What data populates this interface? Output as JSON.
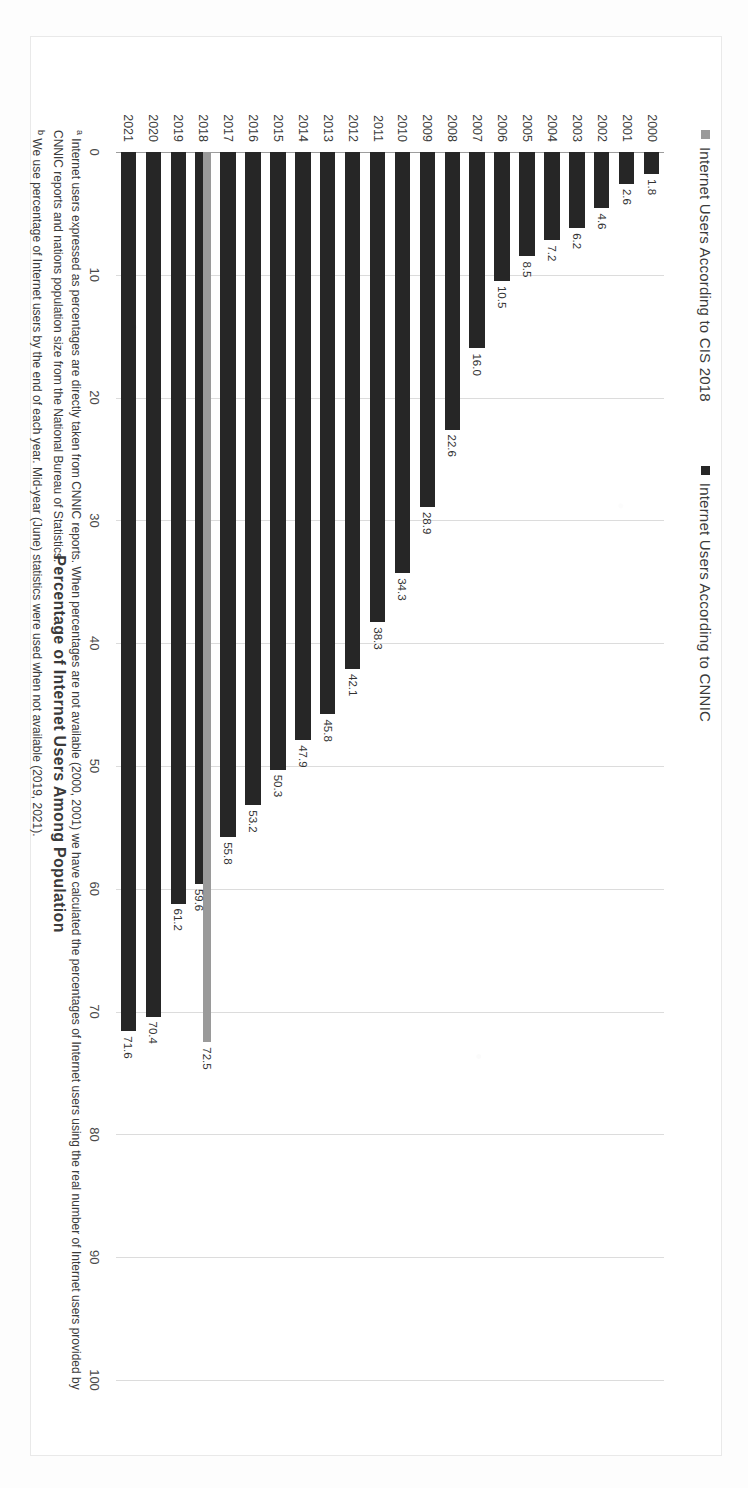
{
  "chart_data": {
    "type": "bar",
    "title": "",
    "xlabel": "",
    "ylabel": "Percentage of Internet Users Among Population",
    "orientation": "vertical",
    "ylim": [
      0,
      100
    ],
    "yticks": [
      "0",
      "10",
      "20",
      "30",
      "40",
      "50",
      "60",
      "70",
      "80",
      "90",
      "100"
    ],
    "grid": true,
    "legend_position": "top-left",
    "categories": [
      "2000",
      "2001",
      "2002",
      "2003",
      "2004",
      "2005",
      "2006",
      "2007",
      "2008",
      "2009",
      "2010",
      "2011",
      "2012",
      "2013",
      "2014",
      "2015",
      "2016",
      "2017",
      "2018",
      "2019",
      "2020",
      "2021"
    ],
    "series": [
      {
        "name": "Internet Users According to CIS 2018",
        "color": "#9a9a9a",
        "values": [
          null,
          null,
          null,
          null,
          null,
          null,
          null,
          null,
          null,
          null,
          null,
          null,
          null,
          null,
          null,
          null,
          null,
          null,
          72.5,
          null,
          null,
          null
        ]
      },
      {
        "name": "Internet Users According to CNNIC",
        "color": "#262626",
        "values": [
          1.8,
          2.6,
          4.6,
          6.2,
          7.2,
          8.5,
          10.5,
          16.0,
          22.6,
          28.9,
          34.3,
          38.3,
          42.1,
          45.8,
          47.9,
          50.3,
          53.2,
          55.8,
          59.6,
          61.2,
          70.4,
          71.6
        ]
      }
    ],
    "data_labels": {
      "2000": [
        "1.8"
      ],
      "2001": [
        "2.6"
      ],
      "2002": [
        "4.6"
      ],
      "2003": [
        "6.2"
      ],
      "2004": [
        "7.2"
      ],
      "2005": [
        "8.5"
      ],
      "2006": [
        "10.5"
      ],
      "2007": [
        "16.0"
      ],
      "2008": [
        "22.6"
      ],
      "2009": [
        "28.9"
      ],
      "2010": [
        "34.3"
      ],
      "2011": [
        "38.3"
      ],
      "2012": [
        "42.1"
      ],
      "2013": [
        "45.8"
      ],
      "2014": [
        "47.9"
      ],
      "2015": [
        "50.3"
      ],
      "2016": [
        "53.2"
      ],
      "2017": [
        "55.8"
      ],
      "2018": [
        "72.5",
        "59.6"
      ],
      "2019": [
        "61.2"
      ],
      "2020": [
        "70.4"
      ],
      "2021": [
        "71.6"
      ]
    }
  },
  "legend": {
    "items": [
      {
        "label": "Internet Users According to CIS 2018",
        "color": "#9a9a9a"
      },
      {
        "label": "Internet Users According to CNNIC",
        "color": "#262626"
      }
    ]
  },
  "axis": {
    "y_title": "Percentage of Internet Users Among Population"
  },
  "notes": {
    "note_a_marker": "a",
    "note_a": " Internet users expressed as percentages are directly taken from CNNIC reports. When percentages are not available (2000, 2001) we have calculated the percentages of Internet users using the real number of Internet users provided by CNNIC reports and nations population size from the National Bureau of Statistics.",
    "note_b_marker": "b",
    "note_b": " We use percentage of Internet users by the end of each year. Mid-year (June) statistics were used when not available (2019, 2021)."
  }
}
